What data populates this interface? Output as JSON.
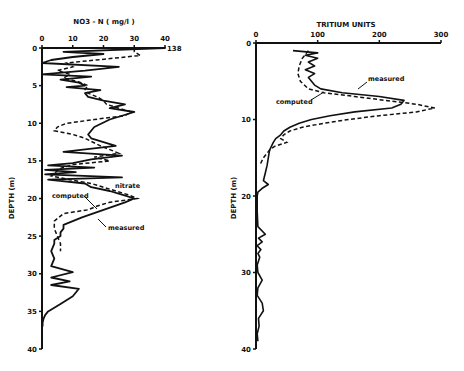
{
  "chart_data": [
    {
      "type": "line",
      "title": "NO3 - N ( mg/l )",
      "xlabel": "NO3 - N ( mg/l )",
      "ylabel": "DEPTH (m)",
      "xlim": [
        0,
        40
      ],
      "ylim": [
        40,
        0
      ],
      "x_ticks": [
        "0",
        "10",
        "20",
        "30",
        "40"
      ],
      "y_ticks": [
        "0",
        "5",
        "10",
        "15",
        "20",
        "25",
        "30",
        "35",
        "40"
      ],
      "grid": false,
      "legend": "inline annotations",
      "annotations": [
        {
          "text": "138",
          "at": [
            40,
            0
          ]
        },
        {
          "text": "nitrate",
          "at": [
            30,
            18.5
          ]
        },
        {
          "text": "computed",
          "at": [
            12,
            20.5
          ]
        },
        {
          "text": "measured",
          "at": [
            23,
            24.5
          ]
        }
      ],
      "series": [
        {
          "name": "measured",
          "style": "solid",
          "depth": [
            0,
            0,
            0.5,
            0.8,
            1.2,
            1.6,
            2.0,
            2.5,
            3.0,
            3.5,
            3.8,
            4.2,
            4.6,
            5.0,
            5.2,
            5.6,
            6.0,
            6.5,
            7.0,
            7.5,
            8.0,
            8.5,
            9.5,
            10.5,
            11.5,
            12.0,
            13.0,
            13.8,
            14.3,
            14.8,
            15.3,
            15.6,
            15.9,
            16.2,
            16.5,
            16.8,
            17.2,
            17.5,
            18.0,
            18.5,
            19.0,
            19.5,
            20.0,
            20.5,
            21.5,
            22.5,
            23.5,
            24.0,
            24.5,
            25.0,
            25.5,
            26.0,
            27.0,
            28.0,
            29.0,
            29.8,
            30.5,
            31.0,
            31.5,
            32.0,
            33.0,
            34.0,
            35.0,
            35.5,
            36.0,
            36.5,
            37.0
          ],
          "nitrate": [
            0,
            40,
            7,
            20,
            10,
            3,
            0,
            25,
            14,
            0,
            16,
            6,
            12,
            14,
            8,
            19,
            14,
            15,
            20,
            27,
            22,
            30,
            22,
            17,
            15,
            16,
            24,
            7,
            26,
            16,
            10,
            2,
            17,
            1,
            11,
            1,
            26,
            2,
            14,
            16,
            22,
            26,
            30,
            27,
            20,
            13,
            7,
            7,
            6,
            6,
            4,
            4,
            3,
            4,
            3,
            10,
            3,
            9,
            3,
            12,
            10,
            6,
            2,
            1,
            0.5,
            0.2,
            0.2
          ]
        },
        {
          "name": "computed",
          "style": "dashed",
          "depth": [
            0,
            0.5,
            1.0,
            2.0,
            2.5,
            3.0,
            3.5,
            4.0,
            4.5,
            5.0,
            5.5,
            6.0,
            6.5,
            7.0,
            7.5,
            8.0,
            8.5,
            9.0,
            9.5,
            10.0,
            10.5,
            11.0,
            11.5,
            12.0,
            13.0,
            14.0,
            14.5,
            15.0,
            15.5,
            16.0,
            17.0,
            17.5,
            18.0,
            19.0,
            19.5,
            20.0,
            20.5,
            21.0,
            21.5,
            22.0,
            23.0,
            24.0,
            25.0,
            26.0,
            27.0
          ],
          "nitrate": [
            30,
            30,
            32,
            8,
            10,
            5,
            9,
            7,
            12,
            15,
            14,
            15,
            18,
            20,
            21,
            25,
            29,
            27,
            17,
            8,
            5,
            4,
            10,
            14,
            19,
            25,
            17,
            22,
            10,
            6,
            3,
            9,
            16,
            24,
            28,
            31,
            22,
            18,
            15,
            7,
            4,
            4,
            5,
            6,
            6
          ]
        }
      ]
    },
    {
      "type": "line",
      "title": "TRITIUM UNITS",
      "xlabel": "TRITIUM UNITS",
      "ylabel": "DEPTH (m)",
      "xlim": [
        0,
        300
      ],
      "ylim": [
        40,
        0
      ],
      "x_ticks": [
        "0",
        "100",
        "200",
        "300"
      ],
      "y_ticks": [
        "0",
        "10",
        "20",
        "30",
        "40"
      ],
      "grid": false,
      "legend": "inline annotations",
      "annotations": [
        {
          "text": "measured",
          "at": [
            185,
            6.3
          ]
        },
        {
          "text": "computed",
          "at": [
            35,
            8.5
          ]
        }
      ],
      "series": [
        {
          "name": "measured",
          "style": "solid",
          "depth": [
            1.0,
            1.3,
            1.6,
            2.0,
            2.5,
            3.0,
            3.5,
            4.0,
            4.5,
            5.0,
            5.5,
            6.0,
            6.5,
            7.0,
            7.5,
            8.0,
            8.5,
            9.0,
            9.5,
            10.0,
            10.5,
            11.0,
            11.5,
            12.0,
            12.5,
            13.0,
            13.5,
            14.0,
            15.0,
            16.0,
            17.0,
            18.0,
            18.5,
            19.0,
            19.5,
            20.0,
            22.0,
            24.0,
            25.0,
            25.5,
            26.0,
            26.5,
            27.0,
            27.5,
            28.0,
            29.0,
            30.0,
            31.0,
            32.0,
            33.0,
            34.0,
            35.0,
            36.0,
            37.0,
            38.0,
            39.0
          ],
          "tritium": [
            60,
            100,
            80,
            100,
            85,
            95,
            80,
            95,
            85,
            90,
            95,
            105,
            140,
            200,
            240,
            235,
            220,
            160,
            120,
            90,
            70,
            55,
            45,
            40,
            32,
            28,
            25,
            22,
            20,
            18,
            15,
            12,
            20,
            10,
            3,
            2,
            2,
            3,
            15,
            4,
            10,
            2,
            8,
            3,
            6,
            2,
            3,
            10,
            3,
            2,
            10,
            12,
            4,
            5,
            2,
            3
          ]
        },
        {
          "name": "computed",
          "style": "dashed",
          "depth": [
            1.0,
            2.0,
            3.0,
            4.0,
            5.0,
            6.0,
            6.5,
            7.0,
            7.5,
            8.0,
            8.5,
            9.0,
            9.5,
            10.0,
            10.5,
            11.0,
            11.5,
            12.0,
            12.5,
            13.0,
            13.5,
            14.0,
            15.0,
            16.0
          ],
          "tritium": [
            85,
            75,
            70,
            68,
            72,
            85,
            110,
            160,
            210,
            260,
            290,
            260,
            200,
            150,
            110,
            75,
            55,
            45,
            40,
            50,
            30,
            22,
            12,
            6
          ]
        }
      ]
    }
  ],
  "labels": {
    "left": {
      "axis_title": "NO3 - N ( mg/l )",
      "y_title": "DEPTH (m)",
      "x_ticks": [
        "0",
        "10",
        "20",
        "30",
        "40"
      ],
      "y_ticks": [
        "0",
        "5",
        "10",
        "15",
        "20",
        "25",
        "30",
        "35",
        "40"
      ],
      "overflow": "138",
      "ann_nitrate": "nitrate",
      "ann_computed": "computed",
      "ann_measured": "measured"
    },
    "right": {
      "axis_title": "TRITIUM UNITS",
      "y_title": "DEPTH (m)",
      "x_ticks": [
        "0",
        "100",
        "200",
        "300"
      ],
      "y_ticks": [
        "0",
        "10",
        "20",
        "30",
        "40"
      ],
      "ann_measured": "measured",
      "ann_computed": "computed"
    }
  }
}
